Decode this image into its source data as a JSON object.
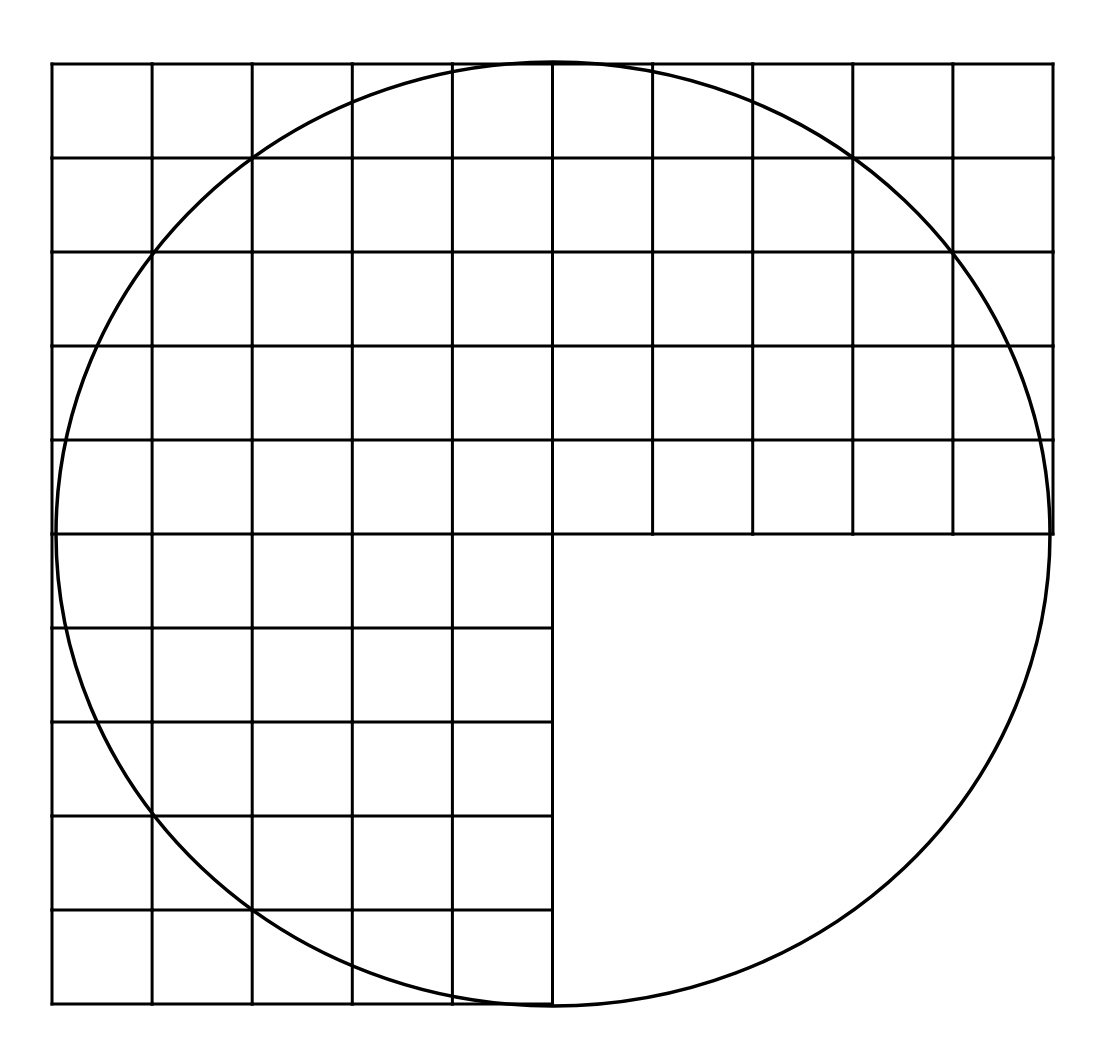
{
  "diagram": {
    "grid": {
      "columns": 10,
      "rows": 10,
      "origin_x": 52,
      "origin_y": 64,
      "cell_width": 100.1,
      "cell_height": 94.0,
      "missing_quadrant": {
        "from_column": 5,
        "to_column": 9,
        "from_row": 5,
        "to_row": 9
      }
    },
    "circle": {
      "center_x": 553,
      "center_y": 534,
      "radius_x": 497,
      "radius_y": 472
    },
    "colors": {
      "line": "#000000",
      "background": "#ffffff"
    }
  }
}
